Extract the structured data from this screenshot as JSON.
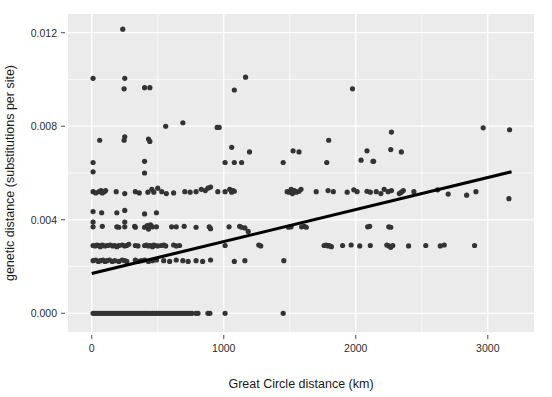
{
  "figure": {
    "title": "",
    "background_color": "#ffffff",
    "panel_color": "#ebebeb",
    "gridline_color": "#ffffff",
    "point_color": "#333333",
    "fit_line_color": "#000000"
  },
  "axes": {
    "x": {
      "label": "Great Circle distance (km)",
      "ticks": [
        "0",
        "1000",
        "2000",
        "3000"
      ],
      "tick_values": [
        0,
        1000,
        2000,
        3000
      ],
      "minor_tick_values": [
        500,
        1500,
        2500
      ],
      "range": [
        -180,
        3350
      ]
    },
    "y": {
      "label": "genetic distance (substitutions per site)",
      "ticks": [
        "0.000",
        "0.004",
        "0.008",
        "0.012"
      ],
      "tick_values": [
        0,
        0.004,
        0.008,
        0.012
      ],
      "minor_tick_values": [
        0.002,
        0.006,
        0.01
      ],
      "range": [
        -0.0008,
        0.0128
      ]
    }
  },
  "chart_data": {
    "type": "scatter",
    "title": "",
    "xlabel": "Great Circle distance (km)",
    "ylabel": "genetic distance (substitutions per site)",
    "xlim": [
      -180,
      3350
    ],
    "ylim": [
      -0.0008,
      0.0128
    ],
    "grid": true,
    "legend": "none",
    "annotations": [],
    "fit_line": {
      "type": "linear",
      "x": [
        0,
        3180
      ],
      "y": [
        0.0017,
        0.00605
      ],
      "intercept": 0.0017,
      "slope": 1.37e-06
    },
    "series": [
      {
        "name": "pairwise comparisons",
        "marker": "circle",
        "color": "#333333",
        "points": [
          [
            235,
            0.01215
          ],
          [
            10,
            0.01005
          ],
          [
            250,
            0.01005
          ],
          [
            1165,
            0.0101
          ],
          [
            245,
            0.0096
          ],
          [
            400,
            0.00965
          ],
          [
            440,
            0.00965
          ],
          [
            1080,
            0.00955
          ],
          [
            1975,
            0.0096
          ],
          [
            560,
            0.008
          ],
          [
            950,
            0.00795
          ],
          [
            965,
            0.00795
          ],
          [
            2965,
            0.00793
          ],
          [
            3165,
            0.00785
          ],
          [
            690,
            0.00815
          ],
          [
            60,
            0.0074
          ],
          [
            245,
            0.0074
          ],
          [
            250,
            0.00755
          ],
          [
            430,
            0.00745
          ],
          [
            440,
            0.00735
          ],
          [
            1795,
            0.0074
          ],
          [
            2270,
            0.00775
          ],
          [
            1060,
            0.0071
          ],
          [
            1195,
            0.0069
          ],
          [
            1525,
            0.00695
          ],
          [
            1570,
            0.0069
          ],
          [
            2085,
            0.00695
          ],
          [
            2265,
            0.007
          ],
          [
            2345,
            0.0069
          ],
          [
            10,
            0.00645
          ],
          [
            400,
            0.0065
          ],
          [
            1010,
            0.00645
          ],
          [
            1080,
            0.00645
          ],
          [
            1135,
            0.00645
          ],
          [
            1450,
            0.00645
          ],
          [
            1780,
            0.00645
          ],
          [
            2040,
            0.00655
          ],
          [
            2130,
            0.0065
          ],
          [
            2135,
            0.0065
          ],
          [
            10,
            0.00605
          ],
          [
            400,
            0.006
          ],
          [
            10,
            0.0052
          ],
          [
            30,
            0.00515
          ],
          [
            55,
            0.0052
          ],
          [
            70,
            0.00525
          ],
          [
            80,
            0.00515
          ],
          [
            95,
            0.0052
          ],
          [
            105,
            0.00525
          ],
          [
            185,
            0.0052
          ],
          [
            250,
            0.00512
          ],
          [
            330,
            0.0052
          ],
          [
            360,
            0.00515
          ],
          [
            425,
            0.00518
          ],
          [
            455,
            0.0053
          ],
          [
            470,
            0.00518
          ],
          [
            500,
            0.00535
          ],
          [
            530,
            0.0052
          ],
          [
            565,
            0.00512
          ],
          [
            620,
            0.00515
          ],
          [
            705,
            0.0052
          ],
          [
            745,
            0.00518
          ],
          [
            790,
            0.0052
          ],
          [
            830,
            0.0053
          ],
          [
            860,
            0.00525
          ],
          [
            880,
            0.00535
          ],
          [
            900,
            0.0054
          ],
          [
            955,
            0.0052
          ],
          [
            1010,
            0.0052
          ],
          [
            1045,
            0.0053
          ],
          [
            1060,
            0.00518
          ],
          [
            1070,
            0.00525
          ],
          [
            1080,
            0.00522
          ],
          [
            1480,
            0.0052
          ],
          [
            1495,
            0.00518
          ],
          [
            1510,
            0.0053
          ],
          [
            1520,
            0.00512
          ],
          [
            1535,
            0.00525
          ],
          [
            1550,
            0.00518
          ],
          [
            1570,
            0.00522
          ],
          [
            1585,
            0.0053
          ],
          [
            1700,
            0.0052
          ],
          [
            1790,
            0.00525
          ],
          [
            1830,
            0.0052
          ],
          [
            1935,
            0.00518
          ],
          [
            1985,
            0.00528
          ],
          [
            2010,
            0.0052
          ],
          [
            2085,
            0.00522
          ],
          [
            2110,
            0.00518
          ],
          [
            2155,
            0.0052
          ],
          [
            2190,
            0.00512
          ],
          [
            2215,
            0.0053
          ],
          [
            2245,
            0.0052
          ],
          [
            2270,
            0.00525
          ],
          [
            2330,
            0.00512
          ],
          [
            2345,
            0.00518
          ],
          [
            2360,
            0.00525
          ],
          [
            2440,
            0.0052
          ],
          [
            2620,
            0.00528
          ],
          [
            2700,
            0.0051
          ],
          [
            2840,
            0.00505
          ],
          [
            2910,
            0.0052
          ],
          [
            3160,
            0.0049
          ],
          [
            10,
            0.00435
          ],
          [
            75,
            0.0043
          ],
          [
            190,
            0.0043
          ],
          [
            250,
            0.0044
          ],
          [
            400,
            0.00425
          ],
          [
            490,
            0.0043
          ],
          [
            10,
            0.0039
          ],
          [
            250,
            0.0039
          ],
          [
            10,
            0.0037
          ],
          [
            80,
            0.00372
          ],
          [
            190,
            0.0037
          ],
          [
            205,
            0.00368
          ],
          [
            250,
            0.0037
          ],
          [
            325,
            0.00372
          ],
          [
            330,
            0.00368
          ],
          [
            400,
            0.00368
          ],
          [
            420,
            0.00375
          ],
          [
            430,
            0.0036
          ],
          [
            445,
            0.00378
          ],
          [
            460,
            0.0037
          ],
          [
            490,
            0.0037
          ],
          [
            605,
            0.0037
          ],
          [
            640,
            0.0037
          ],
          [
            700,
            0.00372
          ],
          [
            790,
            0.00368
          ],
          [
            890,
            0.0037
          ],
          [
            900,
            0.00362
          ],
          [
            1040,
            0.0037
          ],
          [
            1120,
            0.00372
          ],
          [
            1135,
            0.00368
          ],
          [
            1160,
            0.00365
          ],
          [
            1185,
            0.0035
          ],
          [
            1490,
            0.00368
          ],
          [
            1510,
            0.0037
          ],
          [
            1590,
            0.0037
          ],
          [
            1610,
            0.00372
          ],
          [
            1625,
            0.00368
          ],
          [
            2090,
            0.0037
          ],
          [
            2105,
            0.00372
          ],
          [
            2250,
            0.0037
          ],
          [
            2265,
            0.00368
          ],
          [
            10,
            0.0029
          ],
          [
            25,
            0.00288
          ],
          [
            40,
            0.00292
          ],
          [
            55,
            0.0029
          ],
          [
            65,
            0.00285
          ],
          [
            80,
            0.00292
          ],
          [
            100,
            0.00288
          ],
          [
            120,
            0.0029
          ],
          [
            140,
            0.00292
          ],
          [
            160,
            0.00288
          ],
          [
            175,
            0.0029
          ],
          [
            190,
            0.00285
          ],
          [
            205,
            0.0029
          ],
          [
            230,
            0.00292
          ],
          [
            250,
            0.00288
          ],
          [
            265,
            0.0029
          ],
          [
            280,
            0.00295
          ],
          [
            330,
            0.0029
          ],
          [
            350,
            0.00288
          ],
          [
            400,
            0.0029
          ],
          [
            415,
            0.00292
          ],
          [
            430,
            0.00288
          ],
          [
            445,
            0.0029
          ],
          [
            460,
            0.00285
          ],
          [
            470,
            0.00292
          ],
          [
            480,
            0.0029
          ],
          [
            500,
            0.00288
          ],
          [
            525,
            0.0029
          ],
          [
            545,
            0.00292
          ],
          [
            560,
            0.00288
          ],
          [
            620,
            0.00292
          ],
          [
            640,
            0.00288
          ],
          [
            665,
            0.0029
          ],
          [
            1010,
            0.0029
          ],
          [
            1265,
            0.00292
          ],
          [
            1280,
            0.00288
          ],
          [
            1760,
            0.0029
          ],
          [
            1775,
            0.00292
          ],
          [
            1790,
            0.00288
          ],
          [
            1800,
            0.0029
          ],
          [
            1815,
            0.00285
          ],
          [
            1900,
            0.0029
          ],
          [
            1965,
            0.00292
          ],
          [
            2030,
            0.00288
          ],
          [
            2110,
            0.0029
          ],
          [
            2235,
            0.00292
          ],
          [
            2250,
            0.00288
          ],
          [
            2265,
            0.00282
          ],
          [
            2280,
            0.0029
          ],
          [
            2400,
            0.00288
          ],
          [
            2530,
            0.0029
          ],
          [
            2640,
            0.00288
          ],
          [
            2670,
            0.00292
          ],
          [
            2900,
            0.0029
          ],
          [
            10,
            0.00225
          ],
          [
            30,
            0.00228
          ],
          [
            50,
            0.00222
          ],
          [
            65,
            0.00225
          ],
          [
            85,
            0.00228
          ],
          [
            100,
            0.00222
          ],
          [
            115,
            0.00225
          ],
          [
            135,
            0.00228
          ],
          [
            155,
            0.00222
          ],
          [
            175,
            0.00225
          ],
          [
            205,
            0.00222
          ],
          [
            230,
            0.00228
          ],
          [
            250,
            0.00225
          ],
          [
            265,
            0.00222
          ],
          [
            330,
            0.00228
          ],
          [
            350,
            0.00222
          ],
          [
            375,
            0.00225
          ],
          [
            400,
            0.00228
          ],
          [
            430,
            0.00222
          ],
          [
            460,
            0.00225
          ],
          [
            490,
            0.00228
          ],
          [
            545,
            0.00225
          ],
          [
            590,
            0.00222
          ],
          [
            640,
            0.00228
          ],
          [
            690,
            0.00225
          ],
          [
            730,
            0.00222
          ],
          [
            790,
            0.00225
          ],
          [
            840,
            0.00222
          ],
          [
            900,
            0.00228
          ],
          [
            1080,
            0.00222
          ],
          [
            1160,
            0.00225
          ],
          [
            1455,
            0.00225
          ],
          [
            10,
            0.0
          ],
          [
            25,
            0.0
          ],
          [
            40,
            0.0
          ],
          [
            55,
            0.0
          ],
          [
            70,
            0.0
          ],
          [
            85,
            0.0
          ],
          [
            100,
            0.0
          ],
          [
            115,
            0.0
          ],
          [
            130,
            0.0
          ],
          [
            145,
            0.0
          ],
          [
            160,
            0.0
          ],
          [
            175,
            0.0
          ],
          [
            190,
            0.0
          ],
          [
            205,
            0.0
          ],
          [
            220,
            0.0
          ],
          [
            235,
            0.0
          ],
          [
            250,
            0.0
          ],
          [
            265,
            0.0
          ],
          [
            280,
            0.0
          ],
          [
            295,
            0.0
          ],
          [
            310,
            0.0
          ],
          [
            325,
            0.0
          ],
          [
            340,
            0.0
          ],
          [
            355,
            0.0
          ],
          [
            370,
            0.0
          ],
          [
            385,
            0.0
          ],
          [
            400,
            0.0
          ],
          [
            415,
            0.0
          ],
          [
            430,
            0.0
          ],
          [
            445,
            0.0
          ],
          [
            460,
            0.0
          ],
          [
            475,
            0.0
          ],
          [
            490,
            0.0
          ],
          [
            505,
            0.0
          ],
          [
            520,
            0.0
          ],
          [
            535,
            0.0
          ],
          [
            550,
            0.0
          ],
          [
            565,
            0.0
          ],
          [
            580,
            0.0
          ],
          [
            595,
            0.0
          ],
          [
            610,
            0.0
          ],
          [
            625,
            0.0
          ],
          [
            640,
            0.0
          ],
          [
            655,
            0.0
          ],
          [
            670,
            0.0
          ],
          [
            685,
            0.0
          ],
          [
            700,
            0.0
          ],
          [
            715,
            0.0
          ],
          [
            730,
            0.0
          ],
          [
            745,
            0.0
          ],
          [
            760,
            0.0
          ],
          [
            790,
            0.0
          ],
          [
            805,
            0.0
          ],
          [
            880,
            0.0
          ],
          [
            895,
            0.0
          ],
          [
            1010,
            0.0
          ],
          [
            1450,
            0.0
          ]
        ]
      }
    ]
  }
}
